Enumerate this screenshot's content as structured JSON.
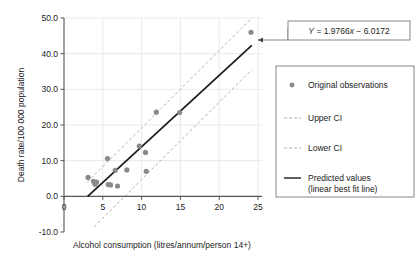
{
  "chart_data": {
    "type": "scatter",
    "title": "",
    "xlabel": "Alcohol consumption (litres/annum/person 14+)",
    "ylabel": "Death rate/100 000 population",
    "xlim": [
      0,
      25
    ],
    "ylim": [
      -10.0,
      50.0
    ],
    "xticks": [
      0,
      5,
      10,
      15,
      20,
      25
    ],
    "xtick_labels": [
      "0",
      "5",
      "10",
      "15",
      "20",
      "25"
    ],
    "yticks": [
      -10.0,
      0.0,
      10.0,
      20.0,
      30.0,
      40.0,
      50.0
    ],
    "ytick_labels": [
      "-10.0",
      "0.0",
      "10.0",
      "20.0",
      "30.0",
      "40.0",
      "50.0"
    ],
    "grid": true,
    "legend_position": "right",
    "annotation": "Y = 1.9766x − 6.0172",
    "annotation_slope": 1.9766,
    "annotation_intercept": -6.0172,
    "series": [
      {
        "name": "Original observations",
        "type": "scatter",
        "marker": "circle",
        "color": "#8a8a8a",
        "points": [
          {
            "x": 3.1,
            "y": 5.3
          },
          {
            "x": 3.8,
            "y": 4.2
          },
          {
            "x": 4.0,
            "y": 3.4
          },
          {
            "x": 4.2,
            "y": 4.0
          },
          {
            "x": 5.6,
            "y": 10.6
          },
          {
            "x": 5.7,
            "y": 3.3
          },
          {
            "x": 6.0,
            "y": 3.2
          },
          {
            "x": 6.9,
            "y": 2.9
          },
          {
            "x": 6.6,
            "y": 7.3
          },
          {
            "x": 8.1,
            "y": 7.4
          },
          {
            "x": 9.7,
            "y": 14.1
          },
          {
            "x": 10.5,
            "y": 12.3
          },
          {
            "x": 10.6,
            "y": 7.0
          },
          {
            "x": 11.9,
            "y": 23.6
          },
          {
            "x": 14.9,
            "y": 23.5
          },
          {
            "x": 24.1,
            "y": 46.0
          }
        ]
      },
      {
        "name": "Predicted values (linear best fit line)",
        "type": "line",
        "style": "solid",
        "color": "#1a1a1a",
        "x_start": 3.05,
        "x_end": 24.2,
        "y_start": 0.0,
        "y_end": 42.3
      },
      {
        "name": "Upper CI",
        "type": "line",
        "style": "dashed",
        "color": "#b0b0b0",
        "x_start": 3.0,
        "x_end": 24.2,
        "y_start": 4.0,
        "y_end": 50.0
      },
      {
        "name": "Lower CI",
        "type": "line",
        "style": "dashed",
        "color": "#b0b0b0",
        "x_start": 3.9,
        "x_end": 24.2,
        "y_start": -8.5,
        "y_end": 35.5
      }
    ]
  },
  "legend": {
    "items": [
      {
        "label": "Original observations",
        "marker": "dot"
      },
      {
        "label": "Upper CI",
        "marker": "dashed-line"
      },
      {
        "label": "Lower CI",
        "marker": "dashed-line"
      },
      {
        "label": "Predicted values",
        "label2": "(linear best fit line)",
        "marker": "solid-line"
      }
    ]
  },
  "equation_box": {
    "y_symbol": "Y",
    "expression": " = 1.9766",
    "x_symbol": "x",
    "tail": " − 6.0172"
  },
  "colors": {
    "marker": "#8a8a8a",
    "fit_line": "#1a1a1a",
    "ci_line": "#b3b3b3",
    "grid": "#e3e3e3",
    "axis": "#555555",
    "box_border": "#7a7a7a",
    "text": "#222222"
  }
}
